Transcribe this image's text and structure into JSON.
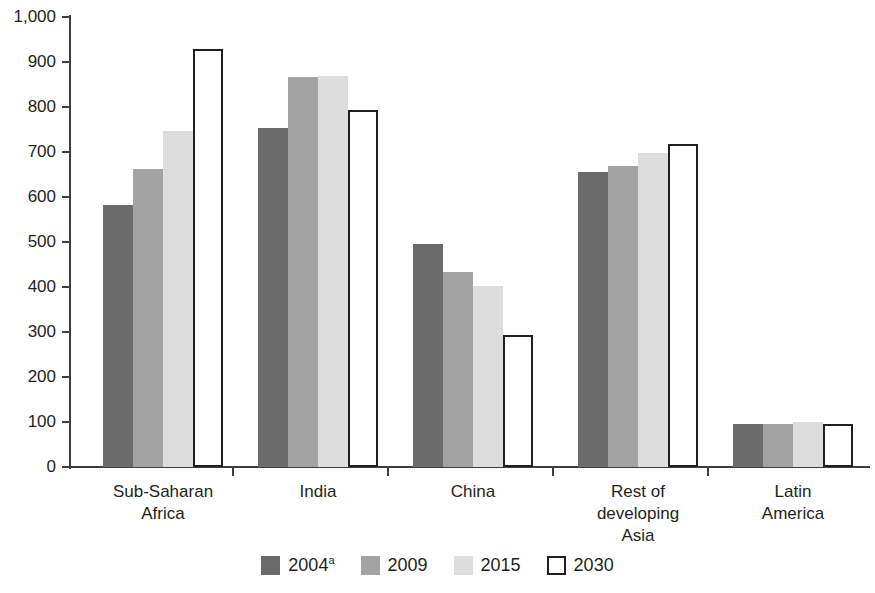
{
  "chart_data": {
    "type": "bar",
    "title": "",
    "subtitle": "",
    "xlabel": "",
    "ylabel": "",
    "ylim": [
      0,
      1000
    ],
    "ytick_step": 100,
    "grid": false,
    "legend_position": "bottom",
    "categories": [
      "Sub-Saharan\nAfrica",
      "India",
      "China",
      "Rest of\ndeveloping\nAsia",
      "Latin\nAmerica"
    ],
    "category_lines": [
      [
        "Sub-Saharan",
        "Africa"
      ],
      [
        "India"
      ],
      [
        "China"
      ],
      [
        "Rest of",
        "developing",
        "Asia"
      ],
      [
        "Latin",
        "America"
      ]
    ],
    "ytick_labels": [
      "0",
      "100",
      "200",
      "300",
      "400",
      "500",
      "600",
      "700",
      "800",
      "900",
      "1,000"
    ],
    "ytick_values": [
      0,
      100,
      200,
      300,
      400,
      500,
      600,
      700,
      800,
      900,
      1000
    ],
    "series": [
      {
        "name": "2004a",
        "label": "2004",
        "label_superscript": "a",
        "color": "#6b6b6b",
        "values": [
          583,
          753,
          495,
          655,
          95
        ]
      },
      {
        "name": "2009",
        "label": "2009",
        "label_superscript": "",
        "color": "#a3a3a3",
        "values": [
          662,
          866,
          433,
          668,
          96
        ]
      },
      {
        "name": "2015",
        "label": "2015",
        "label_superscript": "",
        "color": "#dddddd",
        "values": [
          747,
          870,
          403,
          698,
          99
        ]
      },
      {
        "name": "2030",
        "label": "2030",
        "label_superscript": "",
        "color": "#ffffff",
        "outline": "#231f20",
        "values": [
          928,
          793,
          293,
          718,
          96
        ]
      }
    ]
  },
  "colors": {
    "axis": "#3f3f3f",
    "text": "#231f20",
    "background": "#ffffff"
  }
}
